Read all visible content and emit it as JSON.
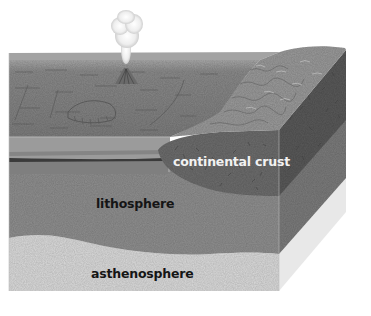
{
  "diagram": {
    "type": "earth-layers-block-diagram",
    "labels": {
      "continental_crust": "continental crust",
      "lithosphere": "lithosphere",
      "asthenosphere": "asthenosphere"
    },
    "features": [
      "volcano-with-ash-plume",
      "ocean-floor",
      "mountain-range",
      "continental-crust",
      "lithosphere",
      "asthenosphere"
    ],
    "colors": {
      "background": "#ffffff",
      "ocean_surface": "#8c8c8c",
      "continental_crust": "#6e6e6e",
      "lithosphere": "#8f8f8f",
      "asthenosphere": "#d9d9d9",
      "plume": "#efefef"
    }
  }
}
